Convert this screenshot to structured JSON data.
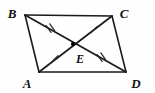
{
  "figure": {
    "kind": "parallelogram-with-diagonals",
    "background_color": "#fefefe",
    "stroke_color": "#1a1a1a",
    "label_color": "#111111",
    "vertices": [
      {
        "name": "B",
        "label": "B",
        "x": 25,
        "y": 15,
        "label_x": 12,
        "label_y": 15
      },
      {
        "name": "C",
        "label": "C",
        "x": 112,
        "y": 16,
        "label_x": 124,
        "label_y": 15
      },
      {
        "name": "A",
        "label": "A",
        "x": 39,
        "y": 72,
        "label_x": 27,
        "label_y": 85
      },
      {
        "name": "D",
        "label": "D",
        "x": 126,
        "y": 72,
        "label_x": 136,
        "label_y": 85
      }
    ],
    "intersection": {
      "name": "E",
      "label": "E",
      "x": 73,
      "y": 44,
      "label_x": 80,
      "label_y": 60,
      "dot_radius": 2.1
    },
    "edges": [
      {
        "name": "edge-BC",
        "from": "B",
        "to": "C"
      },
      {
        "name": "edge-CD",
        "from": "C",
        "to": "D"
      },
      {
        "name": "edge-DA",
        "from": "D",
        "to": "A"
      },
      {
        "name": "edge-AB",
        "from": "A",
        "to": "B"
      }
    ],
    "diagonals": [
      {
        "name": "diagonal-BD",
        "from": "B",
        "to": "D"
      },
      {
        "name": "diagonal-AC",
        "from": "A",
        "to": "C"
      }
    ],
    "tick_marks": [
      {
        "name": "tick-segment-BE",
        "segment": "BE",
        "count": 2,
        "x": 49,
        "y": 29
      },
      {
        "name": "tick-segment-ED",
        "segment": "ED",
        "count": 2,
        "x": 100,
        "y": 58
      },
      {
        "name": "tick-segment-CE",
        "segment": "CE",
        "count": 1,
        "x": 94,
        "y": 29
      },
      {
        "name": "tick-segment-AE",
        "segment": "AE",
        "count": 1,
        "x": 55,
        "y": 58
      }
    ]
  }
}
